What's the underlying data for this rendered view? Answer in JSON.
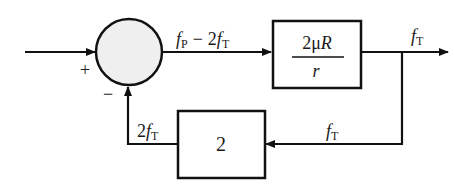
{
  "diagram": {
    "type": "block-diagram",
    "summing_junction": {
      "plus_sign": "+",
      "minus_sign": "−",
      "fill": "#efefef"
    },
    "forward_signal": {
      "f": "f",
      "sub_p": "P",
      "minus": "−",
      "two": "2",
      "f2": "f",
      "sub_t": "T"
    },
    "forward_block": {
      "numerator": "2μR",
      "numerator_coef": "2μ",
      "numerator_var": "R",
      "denominator": "r"
    },
    "output_signal": {
      "f": "f",
      "sub": "T"
    },
    "feedback_signal_in": {
      "f": "f",
      "sub": "T"
    },
    "feedback_block": {
      "gain": "2"
    },
    "feedback_signal_out": {
      "coef": "2",
      "f": "f",
      "sub": "T"
    },
    "line_color": "#111111"
  }
}
